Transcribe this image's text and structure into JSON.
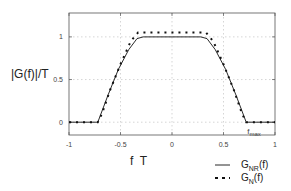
{
  "chart_data": {
    "type": "line",
    "title": "",
    "xlabel": "f  T",
    "ylabel": "|G(f)|/T",
    "xlim": [
      -1,
      1
    ],
    "ylim": [
      -0.15,
      1.28
    ],
    "grid": true,
    "xticks": [
      -1,
      -0.5,
      0,
      0.5,
      1
    ],
    "xtick_labels": [
      "-1",
      "-0.5",
      "0",
      "0.5",
      "1"
    ],
    "yticks": [
      0,
      0.5,
      1
    ],
    "ytick_labels": [
      "0",
      "0.5",
      "1"
    ],
    "annotation": {
      "text": "f",
      "sub": "max",
      "x": 0.72,
      "y": 0
    },
    "legend_position": "bottom-right",
    "series": [
      {
        "name": "G_NR(f)",
        "label_main": "G",
        "label_sub": "NR",
        "label_tail": "(f)",
        "style": "solid",
        "x": [
          -1,
          -0.72,
          -0.62,
          -0.52,
          -0.42,
          -0.34,
          -0.28,
          0.28,
          0.34,
          0.42,
          0.52,
          0.62,
          0.72,
          1
        ],
        "y": [
          0,
          0,
          0.32,
          0.62,
          0.85,
          0.98,
          1.0,
          1.0,
          0.98,
          0.85,
          0.62,
          0.32,
          0,
          0
        ]
      },
      {
        "name": "G_N(f)",
        "label_main": "G",
        "label_sub": "N",
        "label_tail": "(f)",
        "style": "dotted",
        "x": [
          -1,
          -0.72,
          -0.68,
          -0.6,
          -0.5,
          -0.4,
          -0.33,
          0.33,
          0.4,
          0.5,
          0.6,
          0.68,
          0.72,
          1
        ],
        "y": [
          0,
          0,
          0.1,
          0.38,
          0.68,
          0.95,
          1.05,
          1.05,
          0.95,
          0.68,
          0.38,
          0.1,
          0,
          0
        ]
      }
    ]
  }
}
